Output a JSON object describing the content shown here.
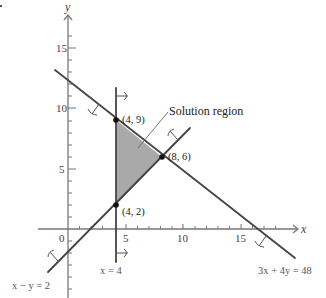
{
  "figure": {
    "title": "",
    "axes": {
      "x_label": "x",
      "y_label": "y",
      "x_ticks": [
        "5",
        "10",
        "15"
      ],
      "y_ticks": [
        "15",
        "10",
        "5"
      ],
      "origin_label": "0"
    },
    "lines": [
      {
        "equation": "3x + 4y = 48",
        "label": "3x + 4y = 48"
      },
      {
        "equation": "x - y = 2",
        "label": "x − y = 2"
      },
      {
        "equation": "x = 4",
        "label": "x = 4"
      }
    ],
    "vertices": [
      {
        "label": "(4, 9)",
        "x": 4,
        "y": 9
      },
      {
        "label": "(8, 6)",
        "x": 8,
        "y": 6
      },
      {
        "label": "(4, 2)",
        "x": 4,
        "y": 2
      }
    ],
    "annotation": "Solution region",
    "colors": {
      "region_fill": "#a8a8a8",
      "line": "#444444",
      "axis": "#777777"
    }
  }
}
